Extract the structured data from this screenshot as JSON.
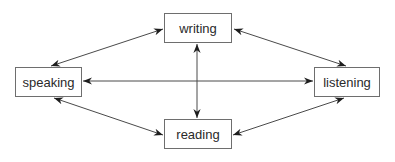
{
  "diagram": {
    "type": "network",
    "nodes": [
      {
        "id": "writing",
        "label": "writing"
      },
      {
        "id": "speaking",
        "label": "speaking"
      },
      {
        "id": "listening",
        "label": "listening"
      },
      {
        "id": "reading",
        "label": "reading"
      }
    ],
    "edges": [
      {
        "from": "writing",
        "to": "speaking",
        "direction": "both"
      },
      {
        "from": "writing",
        "to": "listening",
        "direction": "both"
      },
      {
        "from": "speaking",
        "to": "reading",
        "direction": "both"
      },
      {
        "from": "listening",
        "to": "reading",
        "direction": "both"
      },
      {
        "from": "speaking",
        "to": "listening",
        "direction": "both"
      },
      {
        "from": "writing",
        "to": "reading",
        "direction": "both"
      }
    ],
    "colors": {
      "line": "#3a3a3a",
      "border": "#6e6e6e",
      "text": "#2a2a2a"
    }
  }
}
